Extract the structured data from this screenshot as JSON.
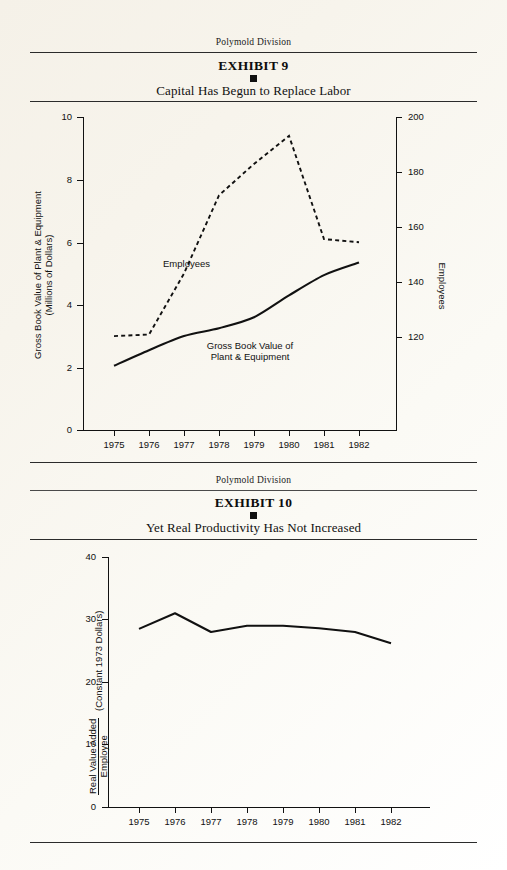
{
  "page": {
    "background_color": "#f7f4ec",
    "ink_color": "#111111"
  },
  "exhibit9": {
    "division": "Polymold Division",
    "exhibit_label": "EXHIBIT 9",
    "subtitle": "Capital Has Begun to Replace Labor",
    "bullet": "square-bullet"
  },
  "exhibit10": {
    "division": "Polymold Division",
    "exhibit_label": "EXHIBIT 10",
    "subtitle": "Yet Real Productivity Has Not Increased",
    "bullet": "square-bullet"
  },
  "chart_data": [
    {
      "id": "exhibit9-chart",
      "type": "line",
      "title": "Capital Has Begun to Replace Labor",
      "xlabel": "",
      "x": [
        "1975",
        "1976",
        "1977",
        "1978",
        "1979",
        "1980",
        "1981",
        "1982"
      ],
      "xlim": [
        1975,
        1982
      ],
      "grid": false,
      "legend": "inline-labels",
      "axes": {
        "left": {
          "label_line1": "Gross Book Value of Plant & Equipment",
          "label_line2": "(Millions of Dollars)",
          "ticks": [
            0,
            2,
            4,
            6,
            8,
            10
          ],
          "tick_labels": [
            "0",
            "2",
            "4",
            "6",
            "8",
            "10"
          ],
          "lim": [
            0,
            10
          ]
        },
        "right": {
          "label": "Employees",
          "ticks": [
            120,
            140,
            160,
            180,
            200
          ],
          "tick_labels": [
            "120",
            "140",
            "160",
            "180",
            "200"
          ],
          "lim": [
            100,
            200
          ]
        }
      },
      "series": [
        {
          "name": "Employees",
          "axis": "right",
          "style": "dashed",
          "label_line1": "Employees",
          "label_line2": "",
          "values": [
            130,
            130.5,
            150,
            175,
            185,
            194,
            161,
            160
          ]
        },
        {
          "name": "Gross Book Value of Plant & Equipment",
          "axis": "left",
          "style": "solid",
          "label_line1": "Gross Book Value of",
          "label_line2": "Plant & Equipment",
          "values": [
            2.05,
            2.55,
            3.0,
            3.25,
            3.6,
            4.3,
            4.95,
            5.35
          ]
        }
      ]
    },
    {
      "id": "exhibit10-chart",
      "type": "line",
      "title": "Yet Real Productivity Has Not Increased",
      "xlabel": "",
      "x": [
        "1975",
        "1976",
        "1977",
        "1978",
        "1979",
        "1980",
        "1981",
        "1982"
      ],
      "xlim": [
        1975,
        1982
      ],
      "grid": false,
      "legend": "none",
      "axes": {
        "left": {
          "label_numerator": "Real Value Added",
          "label_denominator": "Employee",
          "label_units": "(Constant 1973 Dollars)",
          "ticks": [
            0,
            10,
            20,
            30,
            40
          ],
          "tick_labels": [
            "0",
            "10",
            "20",
            "30",
            "40"
          ],
          "lim": [
            0,
            40
          ]
        }
      },
      "series": [
        {
          "name": "Real Value Added per Employee",
          "axis": "left",
          "style": "solid",
          "values": [
            28.5,
            31.0,
            28.0,
            29.0,
            29.0,
            28.6,
            28.0,
            26.2
          ]
        }
      ]
    }
  ]
}
